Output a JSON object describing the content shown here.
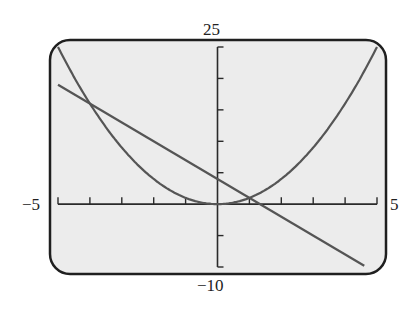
{
  "window_labels": {
    "ymax": "25",
    "ymin": "−10",
    "xmin": "−5",
    "xmax": "5"
  },
  "colors": {
    "screen_bg": "#ececec",
    "frame": "#1f1f1f",
    "axis": "#2a2a2a",
    "curve": "#555555",
    "page_bg": "#ffffff"
  },
  "chart_data": {
    "type": "line",
    "title": "",
    "xlabel": "",
    "ylabel": "",
    "xlim": [
      -5,
      5
    ],
    "ylim": [
      -10,
      25
    ],
    "xscl": 1,
    "yscl": 5,
    "grid": false,
    "legend": "none",
    "series": [
      {
        "name": "y = x^2",
        "kind": "parabola",
        "equation": "x^2",
        "x": [
          -5,
          -4,
          -3,
          -2,
          -1,
          0,
          1,
          2,
          3,
          4,
          5
        ],
        "values": [
          25,
          16,
          9,
          4,
          1,
          0,
          1,
          4,
          9,
          16,
          25
        ]
      },
      {
        "name": "y = -3x + 4",
        "kind": "line",
        "equation": "-3x+4",
        "x": [
          -5,
          -4,
          0,
          1,
          4.6
        ],
        "values": [
          19,
          16,
          4,
          1,
          -9.8
        ]
      }
    ],
    "intersections": [
      {
        "x": -4,
        "y": 16
      },
      {
        "x": 1,
        "y": 1
      }
    ]
  }
}
